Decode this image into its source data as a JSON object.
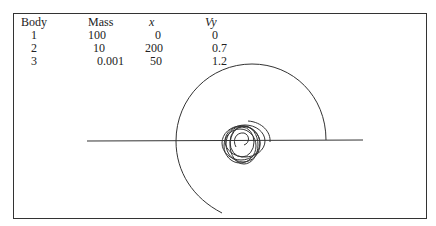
{
  "table": {
    "headers": [
      "Body",
      "Mass",
      "x",
      "Vy"
    ],
    "rows": [
      [
        "1",
        "100",
        "0",
        "0"
      ],
      [
        "2",
        "10",
        "200",
        "0.7"
      ],
      [
        "3",
        "0.001",
        "50",
        "1.2"
      ]
    ]
  },
  "figure": {
    "line_color": "#333333"
  }
}
